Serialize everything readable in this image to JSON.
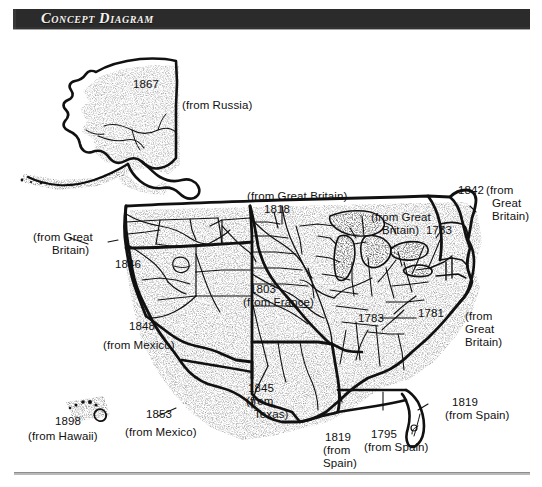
{
  "header": {
    "title": "Concept Diagram"
  },
  "map": {
    "title_alt": "United States territorial acquisitions map",
    "colors": {
      "ink": "#111111",
      "banner_bg": "#2b2b2b",
      "banner_text": "#f4f2ee",
      "paper": "#ffffff",
      "rule": "#b9b9b9"
    }
  },
  "annotations": [
    {
      "id": "alaska",
      "year": "1867",
      "source": "(from Russia)",
      "name": "label-alaska-1867"
    },
    {
      "id": "oregon",
      "year": "1846",
      "source": "(from Great\nBritain)",
      "name": "label-oregon-1846"
    },
    {
      "id": "northern-1818",
      "year": "1818",
      "source": "(from Great Britain)",
      "name": "label-north-1818"
    },
    {
      "id": "louisiana",
      "year": "1803",
      "source": "(from France)",
      "name": "label-louisiana-1803"
    },
    {
      "id": "original-1783",
      "year": "1783",
      "source": "(from Great\nBritain)",
      "name": "label-lakes-1783"
    },
    {
      "id": "interior-1783",
      "year": "1783",
      "source": "",
      "name": "label-interior-1783"
    },
    {
      "id": "maine-1842",
      "year": "1842",
      "source": "(from\nGreat\nBritain)",
      "name": "label-maine-1842"
    },
    {
      "id": "colonies-1781",
      "year": "1781",
      "source": "(from\nGreat\nBritain)",
      "name": "label-colonies-1781"
    },
    {
      "id": "mexican",
      "year": "1848",
      "source": "(from Mexico)",
      "name": "label-mexican-cession-1848"
    },
    {
      "id": "texas",
      "year": "1845",
      "source": "(from\nTexas)",
      "name": "label-texas-1845"
    },
    {
      "id": "gadsden",
      "year": "1853",
      "source": "(from Mexico)",
      "name": "label-gadsden-1853"
    },
    {
      "id": "hawaii",
      "year": "1898",
      "source": "(from Hawaii)",
      "name": "label-hawaii-1898"
    },
    {
      "id": "spain-west",
      "year": "1819",
      "source": "(from\nSpain)",
      "name": "label-spain-west-1819"
    },
    {
      "id": "spain-gulf",
      "year": "1795",
      "source": "(from Spain)",
      "name": "label-spain-gulf-1795"
    },
    {
      "id": "florida",
      "year": "1819",
      "source": "(from Spain)",
      "name": "label-florida-1819"
    }
  ],
  "labels": {
    "alaska_year": "1867",
    "alaska_source": "(from Russia)",
    "north_source": "(from Great Britain)",
    "north_year": "1818",
    "lakes_source": "(from Great",
    "lakes_source2": "Britain)",
    "lakes_year": "1783",
    "maine_year": "1842",
    "maine_source1": "(from",
    "maine_source2": "Great",
    "maine_source3": "Britain)",
    "oregon_source1": "(from Great",
    "oregon_source2": "Britain)",
    "oregon_year": "1846",
    "louisiana_year": "1803",
    "louisiana_source": "(from France)",
    "interior_year": "1783",
    "colonies_year": "1781",
    "colonies_source1": "(from",
    "colonies_source2": "Great",
    "colonies_source3": "Britain)",
    "mexican_year": "1848",
    "mexican_source": "(from Mexico)",
    "texas_year": "1845",
    "texas_source1": "(from",
    "texas_source2": "Texas)",
    "gadsden_year": "1853",
    "gadsden_source": "(from Mexico)",
    "hawaii_year": "1898",
    "hawaii_source": "(from Hawaii)",
    "spainwest_year": "1819",
    "spainwest_source1": "(from",
    "spainwest_source2": "Spain)",
    "spaingulf_year": "1795",
    "spaingulf_source": "(from Spain)",
    "florida_year": "1819",
    "florida_source": "(from Spain)"
  }
}
